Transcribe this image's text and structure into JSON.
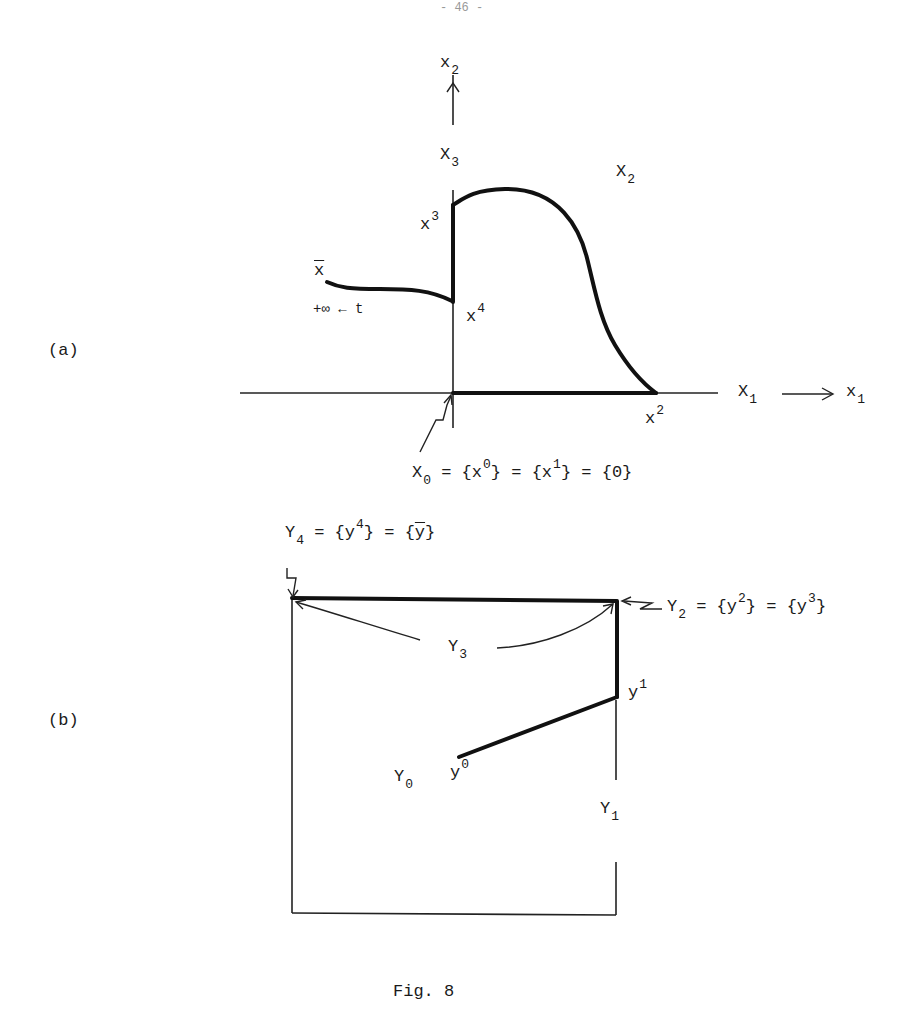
{
  "page": {
    "number": "- 46 -"
  },
  "panel_a": {
    "label": "(a)",
    "axis_x2": {
      "main": "x",
      "sub": "2"
    },
    "set_X3": {
      "main": "X",
      "sub": "3"
    },
    "set_X2": {
      "main": "X",
      "sub": "2"
    },
    "set_X1": {
      "main": "X",
      "sub": "1"
    },
    "axis_x1": {
      "main": "x",
      "sub": "1"
    },
    "point_x3": {
      "main": "x",
      "sup": "3"
    },
    "point_x4": {
      "main": "x",
      "sup": "4"
    },
    "point_x2": {
      "main": "x",
      "sup": "2"
    },
    "xbar": "x",
    "limit_text": "+∞ ← t",
    "x0_caption": {
      "p1": "X",
      "p1sub": "0",
      "p2": " = {x",
      "p2sup": "0",
      "p3": "} = {x",
      "p3sup": "1",
      "p4": "} = {0}"
    }
  },
  "panel_b": {
    "label": "(b)",
    "y4_caption": {
      "p1": "Y",
      "p1sub": "4",
      "p2": " = {y",
      "p2sup": "4",
      "p3": "} = {",
      "p3bar": "y",
      "p4": "}"
    },
    "y2_caption": {
      "p1": "Y",
      "p1sub": "2",
      "p2": " = {y",
      "p2sup": "2",
      "p3": "} = {y",
      "p3sup": "3",
      "p4": "}"
    },
    "set_Y3": {
      "main": "Y",
      "sub": "3"
    },
    "set_Y0": {
      "main": "Y",
      "sub": "0"
    },
    "set_Y1": {
      "main": "Y",
      "sub": "1"
    },
    "point_y1": {
      "main": "y",
      "sup": "1"
    },
    "point_y0": {
      "main": "y",
      "sup": "0"
    }
  },
  "caption": "Fig. 8"
}
